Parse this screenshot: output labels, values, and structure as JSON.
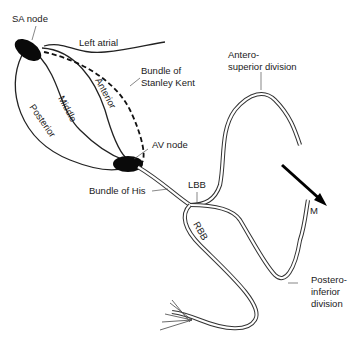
{
  "diagram": {
    "type": "cardiac conduction system",
    "labels": {
      "sa_node": "SA node",
      "left_atrial": "Left atrial",
      "bundle_kent_1": "Bundle of",
      "bundle_kent_2": "Stanley Kent",
      "anterior": "Anterior",
      "middle": "Middle",
      "posterior": "Posterior",
      "av_node": "AV node",
      "bundle_his": "Bundle of His",
      "lbb": "LBB",
      "rbb": "RBB",
      "antero_1": "Antero-",
      "antero_2": "superior division",
      "postero_1": "Postero-",
      "postero_2": "inferior",
      "postero_3": "division",
      "vector_m": "M"
    },
    "nodes": [
      {
        "name": "SA node",
        "cx": 28,
        "cy": 50
      },
      {
        "name": "AV node",
        "cx": 128,
        "cy": 164
      }
    ],
    "vector": {
      "label": "M",
      "from": [
        282,
        165
      ],
      "to": [
        325,
        204
      ]
    }
  }
}
